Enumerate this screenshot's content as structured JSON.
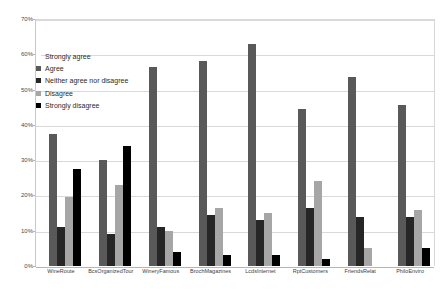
{
  "chart_data": {
    "type": "bar",
    "title": "",
    "xlabel": "",
    "ylabel": "",
    "ylim": [
      0,
      70
    ],
    "ytick_labels": [
      "0%",
      "10%",
      "20%",
      "30%",
      "40%",
      "50%",
      "60%",
      "70%"
    ],
    "ytick_values": [
      0,
      10,
      20,
      30,
      40,
      50,
      60,
      70
    ],
    "grid": true,
    "legend_position": "upper-left-inside",
    "categories": [
      "WineRoute",
      "BcsOrganizedTour",
      "WineryFamous",
      "BrochMagazines",
      "LcdsInternet",
      "RptCustomers",
      "FriendsRelat",
      "PhiloEnviro"
    ],
    "series": [
      {
        "name": "Strongly agree",
        "color": "#f2f2f2",
        "values": [
          0,
          0,
          0,
          0,
          0,
          0,
          0,
          0
        ]
      },
      {
        "name": "Agree",
        "color": "#595959",
        "values": [
          37.5,
          30,
          56.5,
          58,
          63,
          44.5,
          53.5,
          45.5
        ]
      },
      {
        "name": "Neither agree nor disagree",
        "color": "#262626",
        "values": [
          11,
          9,
          11,
          14.5,
          13,
          16.5,
          14,
          14
        ]
      },
      {
        "name": "Disagree",
        "color": "#a6a6a6",
        "values": [
          19.5,
          23,
          10,
          16.5,
          15,
          24,
          5,
          16
        ]
      },
      {
        "name": "Strongly disagree",
        "color": "#000000",
        "values": [
          27.5,
          34,
          4,
          3,
          3,
          2,
          0,
          5
        ]
      }
    ]
  }
}
